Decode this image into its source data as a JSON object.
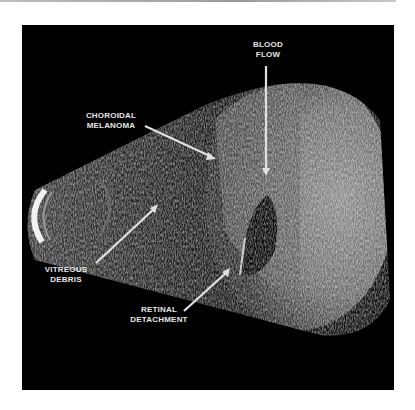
{
  "figure": {
    "labels": {
      "blood_flow": [
        "BLOOD",
        "FLOW"
      ],
      "choroidal_melanoma": [
        "CHOROIDAL",
        "MELANOMA"
      ],
      "vitreous_debris": [
        "VITREOUS",
        "DEBRIS"
      ],
      "retinal_detachment": [
        "RETINAL",
        "DETACHMENT"
      ]
    },
    "colors": {
      "background": "#000000",
      "label_text": "#e6e6e6",
      "arrow": "#e0e0e0",
      "page": "#ffffff"
    }
  }
}
